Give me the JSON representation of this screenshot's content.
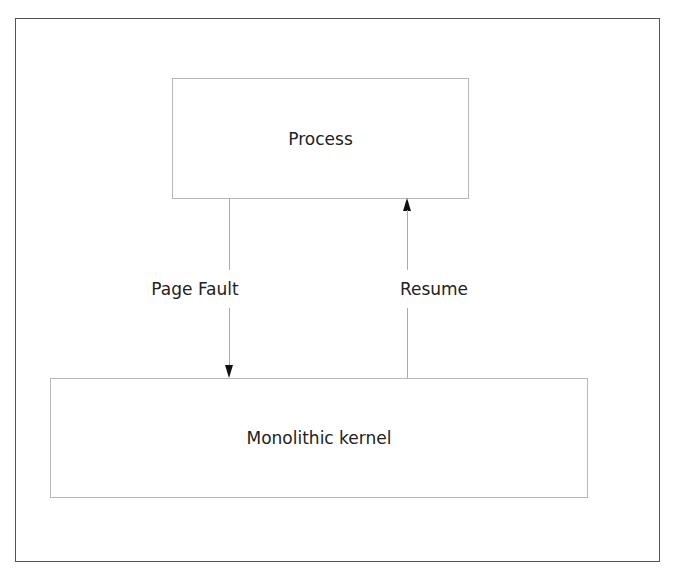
{
  "diagram": {
    "nodes": [
      {
        "id": "process",
        "label": "Process"
      },
      {
        "id": "kernel",
        "label": "Monolithic kernel"
      }
    ],
    "edges": [
      {
        "from": "process",
        "to": "kernel",
        "label": "Page Fault",
        "direction": "down"
      },
      {
        "from": "kernel",
        "to": "process",
        "label": "Resume",
        "direction": "up"
      }
    ],
    "colors": {
      "frame": "#555555",
      "box_border": "#b8b8b8",
      "connector": "#aaaaaa",
      "arrowhead": "#111111",
      "text": "#222222",
      "background": "#ffffff"
    }
  }
}
